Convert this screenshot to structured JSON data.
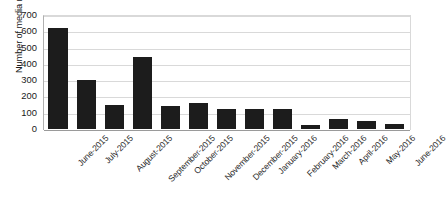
{
  "chart_data": {
    "type": "bar",
    "title": "",
    "xlabel": "",
    "ylabel": "Number of media mentions",
    "ylim": [
      0,
      700
    ],
    "ytick_values": [
      700,
      600,
      500,
      400,
      300,
      200,
      100,
      0
    ],
    "ytick_labels": [
      "700",
      "600",
      "500",
      "400",
      "300",
      "200",
      "100",
      "0"
    ],
    "grid": true,
    "legend": "none",
    "bar_color": "#1c1c1c",
    "categories": [
      "June-2015",
      "July-2015",
      "August-2015",
      "September-2015",
      "October-2015",
      "November-2015",
      "December-2015",
      "January-2016",
      "February-2016",
      "March-2016",
      "April-2016",
      "May-2016",
      "June-2016"
    ],
    "values": [
      620,
      300,
      150,
      440,
      140,
      160,
      120,
      125,
      120,
      25,
      60,
      50,
      30
    ]
  }
}
